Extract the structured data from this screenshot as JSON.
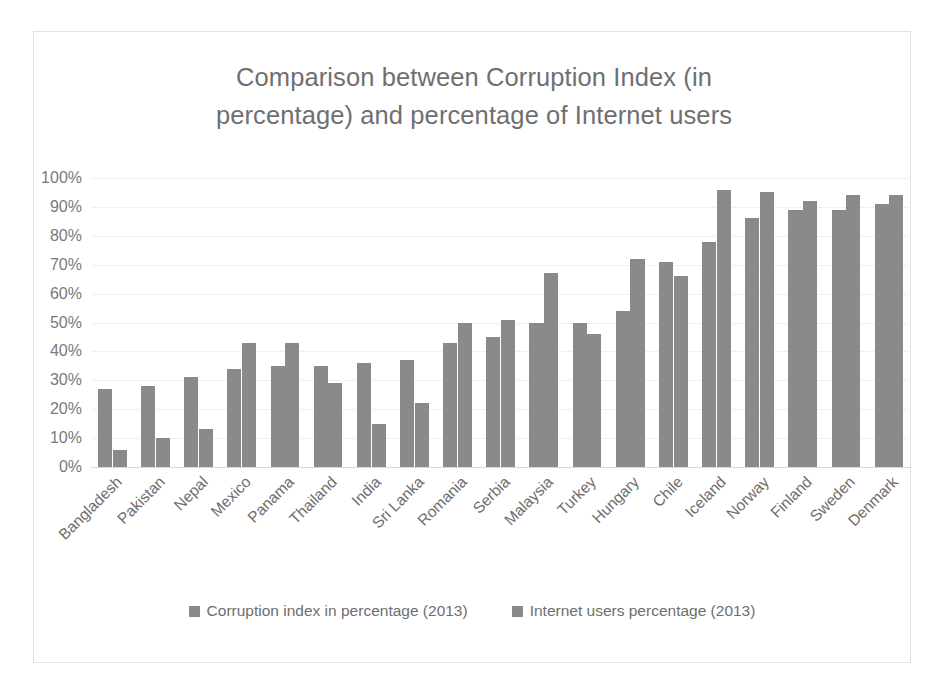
{
  "chart_data": {
    "type": "bar",
    "title": "Comparison between Corruption Index (in percentage)  and percentage of Internet users",
    "title_line1": "Comparison between Corruption Index (in",
    "title_line2": "percentage)  and percentage of Internet users",
    "xlabel": "",
    "ylabel": "",
    "ylim": [
      0,
      100
    ],
    "y_tick_labels": [
      "100%",
      "90%",
      "80%",
      "70%",
      "60%",
      "50%",
      "40%",
      "30%",
      "20%",
      "10%",
      "0%"
    ],
    "y_tick_values": [
      100,
      90,
      80,
      70,
      60,
      50,
      40,
      30,
      20,
      10,
      0
    ],
    "grid": true,
    "legend_position": "bottom",
    "bar_color": "#8a8a8a",
    "categories": [
      "Bangladesh",
      "Pakistan",
      "Nepal",
      "Mexico",
      "Panama",
      "Thailand",
      "India",
      "Sri Lanka",
      "Romania",
      "Serbia",
      "Malaysia",
      "Turkey",
      "Hungary",
      "Chile",
      "Iceland",
      "Norway",
      "Finland",
      "Sweden",
      "Denmark"
    ],
    "series": [
      {
        "name": "Corruption index in percentage (2013)",
        "values": [
          27,
          28,
          31,
          34,
          35,
          35,
          36,
          37,
          43,
          45,
          50,
          50,
          54,
          71,
          78,
          86,
          89,
          89,
          91
        ]
      },
      {
        "name": "Internet users percentage (2013)",
        "values": [
          6,
          10,
          13,
          43,
          43,
          29,
          15,
          22,
          50,
          51,
          67,
          46,
          72,
          66,
          96,
          95,
          92,
          94,
          94
        ]
      }
    ]
  },
  "legend": {
    "items": [
      {
        "label": "Corruption index in percentage (2013)",
        "color": "#8a8a8a"
      },
      {
        "label": "Internet users percentage (2013)",
        "color": "#8a8a8a"
      }
    ]
  }
}
